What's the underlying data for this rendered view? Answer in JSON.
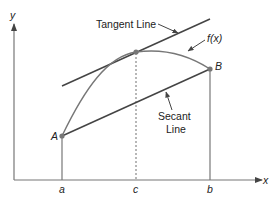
{
  "diagram": {
    "title_labels": {
      "tangent_line": "Tangent Line",
      "secant_line_1": "Secant",
      "secant_line_2": "Line",
      "function": "f(x)"
    },
    "axes": {
      "x_label": "x",
      "y_label": "y"
    },
    "points": {
      "A": "A",
      "B": "B"
    },
    "x_ticks": {
      "a": "a",
      "c": "c",
      "b": "b"
    },
    "colors": {
      "line": "#444444",
      "curve": "#777777",
      "point": "#777777",
      "text": "#222222"
    }
  }
}
